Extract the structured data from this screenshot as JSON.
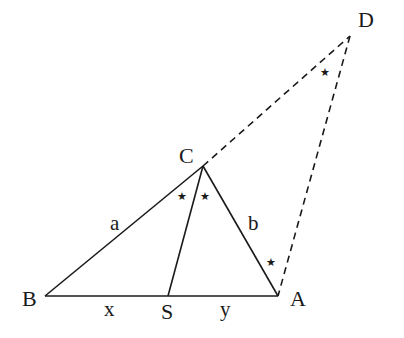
{
  "diagram": {
    "type": "geometry-triangle-angle-bisector",
    "colors": {
      "stroke": "#1a1a1a",
      "background": "#ffffff"
    },
    "points": {
      "B": {
        "label": "B",
        "x": 45,
        "y": 296
      },
      "S": {
        "label": "S",
        "x": 168,
        "y": 296
      },
      "A": {
        "label": "A",
        "x": 278,
        "y": 296
      },
      "C": {
        "label": "C",
        "x": 203,
        "y": 166
      },
      "D": {
        "label": "D",
        "x": 350,
        "y": 36
      }
    },
    "segments_solid": [
      {
        "from": "B",
        "to": "A"
      },
      {
        "from": "B",
        "to": "C"
      },
      {
        "from": "C",
        "to": "A"
      },
      {
        "from": "C",
        "to": "S"
      }
    ],
    "segments_dashed": [
      {
        "from": "C",
        "to": "D"
      },
      {
        "from": "D",
        "to": "A"
      }
    ],
    "side_labels": {
      "a": "a",
      "b": "b",
      "x": "x",
      "y": "y"
    },
    "angle_marks": {
      "symbol": "★",
      "count": 4,
      "locations": [
        "angle BCS",
        "angle SCA",
        "angle CDA",
        "angle CAD"
      ]
    }
  }
}
